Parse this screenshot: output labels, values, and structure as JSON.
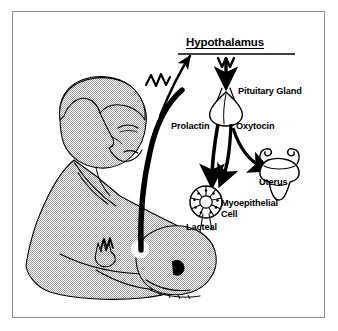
{
  "figure": {
    "title": "Hypothalamus",
    "kind": "biological-flow-diagram",
    "frame_color": "#8d8d8d",
    "background_color": "#ffffff",
    "ink_color": "#000000",
    "skin_tone_fill": "#b4b4b4"
  },
  "labels": {
    "hypothalamus": "Hypothalamus",
    "pituitary_gland": "Pituitary Gland",
    "prolactin": "Prolactin",
    "oxytocin": "Oxytocin",
    "uterus": "Uterus",
    "myoepithelial_cell": "Myoepithelial\nCell",
    "myoepithelial_cell_line1": "Myoepithelial",
    "myoepithelial_cell_line2": "Cell",
    "lacteal": "Lacteal"
  },
  "illustration": {
    "mother_figure": "nursing-mother-halftone-silhouette",
    "infant_figure": "nursing-infant-head",
    "nipple_highlight": "white-areola-circle",
    "infant_hand": "raised-open-hand",
    "nerve_pathway": "thick-black-afferent-nerve-from-nipple-to-hypothalamus",
    "nerve_impulse_symbol": "zigzag-impulse",
    "breast_impulse_symbol": "zigzag-impulse-at-nipple",
    "hypothalamus_impulse_symbol": "zigzag-impulse-below-hypothalamus",
    "pituitary_shape": "bulb-gland-with-stalk",
    "alveolus_shape": "lacteal-alveolus-rosette-with-duct",
    "uterus_shape": "uterus-with-fallopian-tubes-and-ovaries"
  },
  "flow": {
    "steps": [
      {
        "from": "Nipple / suckling stimulus",
        "to": "Hypothalamus",
        "via": "afferent nerve impulse",
        "arrow": "thick-curved-up-arrow"
      },
      {
        "from": "Hypothalamus",
        "to": "Pituitary Gland",
        "via": "neural impulse",
        "arrow": "thick-down-arrow"
      },
      {
        "from": "Pituitary Gland",
        "to": "Lacteal",
        "via": "Prolactin",
        "arrow": "thick-down-arrow"
      },
      {
        "from": "Pituitary Gland",
        "to": "Myoepithelial Cell",
        "via": "Oxytocin",
        "arrow": "curved-arrow-left"
      },
      {
        "from": "Pituitary Gland",
        "to": "Uterus",
        "via": "Oxytocin",
        "arrow": "curved-arrow-right"
      }
    ]
  }
}
